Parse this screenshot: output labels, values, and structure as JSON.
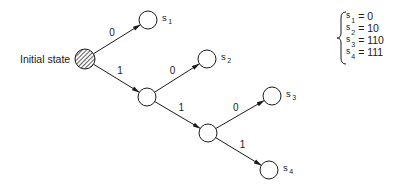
{
  "diagram": {
    "initial_label": "Initial state",
    "nodes": [
      {
        "id": "init",
        "cx": 85,
        "cy": 59,
        "r": 10,
        "hatched": true
      },
      {
        "id": "s1",
        "cx": 148,
        "cy": 20,
        "r": 9,
        "label": "s",
        "sub": "1"
      },
      {
        "id": "n1",
        "cx": 147,
        "cy": 97,
        "r": 9
      },
      {
        "id": "s2",
        "cx": 207,
        "cy": 59,
        "r": 9,
        "label": "s",
        "sub": "2"
      },
      {
        "id": "n2",
        "cx": 208,
        "cy": 133,
        "r": 9
      },
      {
        "id": "s3",
        "cx": 272,
        "cy": 96,
        "r": 9,
        "label": "s",
        "sub": "3"
      },
      {
        "id": "s4",
        "cx": 269,
        "cy": 170,
        "r": 9,
        "label": "s",
        "sub": "4"
      }
    ],
    "edges": [
      {
        "from": "init",
        "to": "s1",
        "label": "0"
      },
      {
        "from": "init",
        "to": "n1",
        "label": "1"
      },
      {
        "from": "n1",
        "to": "s2",
        "label": "0"
      },
      {
        "from": "n1",
        "to": "n2",
        "label": "1"
      },
      {
        "from": "n2",
        "to": "s3",
        "label": "0"
      },
      {
        "from": "n2",
        "to": "s4",
        "label": "1"
      }
    ],
    "codes": [
      {
        "state": "s",
        "sub": "1",
        "value": "= 0"
      },
      {
        "state": "s",
        "sub": "2",
        "value": "= 10"
      },
      {
        "state": "s",
        "sub": "3",
        "value": "= 110"
      },
      {
        "state": "s",
        "sub": "4",
        "value": "= 111"
      }
    ]
  }
}
